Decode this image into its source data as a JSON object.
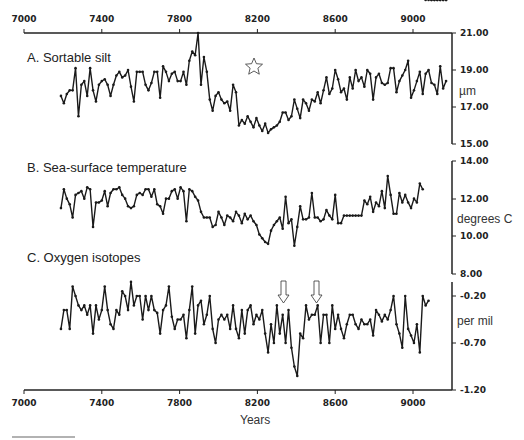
{
  "chart_data": [
    {
      "type": "line",
      "title": "A. Sortable silt",
      "xlabel": "Years",
      "ylabel": "µm",
      "xlim": [
        7000,
        9200
      ],
      "ylim": [
        15.0,
        21.0
      ],
      "yticks": [
        "21.00",
        "19.00",
        "17.00",
        "15.00"
      ],
      "annotations": [
        "star marker near 8200 yr"
      ],
      "x": [
        7190,
        7205,
        7220,
        7235,
        7250,
        7265,
        7280,
        7295,
        7310,
        7325,
        7340,
        7355,
        7370,
        7385,
        7400,
        7415,
        7430,
        7445,
        7460,
        7475,
        7490,
        7505,
        7520,
        7535,
        7550,
        7565,
        7580,
        7595,
        7610,
        7625,
        7640,
        7655,
        7670,
        7685,
        7700,
        7715,
        7730,
        7745,
        7760,
        7775,
        7790,
        7805,
        7820,
        7835,
        7850,
        7865,
        7880,
        7895,
        7910,
        7925,
        7940,
        7955,
        7970,
        7985,
        8000,
        8015,
        8030,
        8045,
        8060,
        8075,
        8090,
        8105,
        8120,
        8135,
        8150,
        8165,
        8180,
        8195,
        8210,
        8225,
        8240,
        8255,
        8270,
        8285,
        8300,
        8315,
        8330,
        8345,
        8360,
        8375,
        8390,
        8405,
        8420,
        8435,
        8450,
        8465,
        8480,
        8495,
        8510,
        8525,
        8540,
        8555,
        8570,
        8585,
        8600,
        8615,
        8630,
        8645,
        8660,
        8675,
        8690,
        8705,
        8720,
        8735,
        8750,
        8765,
        8780,
        8795,
        8810,
        8825,
        8840,
        8855,
        8870,
        8885,
        8900,
        8915,
        8930,
        8945,
        8960,
        8975,
        8990,
        9005,
        9020,
        9035,
        9050,
        9065,
        9080,
        9095,
        9110,
        9125,
        9140,
        9155,
        9170
      ],
      "values": [
        17.6,
        17.2,
        17.7,
        17.9,
        17.9,
        19.1,
        16.5,
        18.2,
        18.4,
        17.6,
        19.1,
        17.9,
        17.3,
        18.2,
        18.4,
        18.5,
        18.2,
        17.6,
        18.2,
        18.7,
        18.9,
        18.6,
        18.7,
        19.0,
        18.1,
        17.3,
        18.9,
        18.9,
        18.9,
        18.2,
        17.9,
        18.3,
        18.9,
        18.9,
        17.5,
        19.2,
        18.9,
        18.4,
        18.8,
        18.9,
        18.4,
        18.4,
        18.9,
        18.2,
        19.5,
        20.0,
        19.8,
        21.0,
        18.2,
        19.7,
        18.9,
        17.4,
        16.8,
        17.6,
        17.8,
        17.4,
        17.2,
        17.3,
        16.8,
        18.2,
        17.8,
        16.0,
        16.3,
        16.1,
        16.5,
        16.2,
        15.9,
        16.4,
        16.0,
        15.7,
        16.1,
        15.6,
        15.8,
        15.9,
        16.0,
        16.2,
        16.7,
        16.7,
        16.3,
        16.5,
        17.4,
        16.9,
        16.4,
        17.4,
        17.2,
        16.8,
        17.4,
        17.3,
        17.8,
        17.2,
        17.9,
        18.6,
        17.7,
        18.0,
        19.0,
        18.5,
        17.8,
        18.0,
        17.4,
        18.6,
        18.0,
        19.0,
        18.4,
        18.6,
        18.1,
        19.0,
        18.8,
        17.4,
        18.6,
        18.8,
        18.3,
        18.2,
        18.3,
        19.1,
        19.1,
        17.8,
        18.4,
        18.7,
        19.0,
        19.5,
        17.5,
        17.9,
        18.4,
        18.9,
        17.7,
        18.8,
        19.0,
        18.3,
        18.2,
        17.7,
        19.2,
        18.0,
        18.4,
        17.9
      ]
    },
    {
      "type": "line",
      "title": "B. Sea-surface temperature",
      "xlabel": "Years",
      "ylabel": "degrees C",
      "xlim": [
        7000,
        9200
      ],
      "ylim": [
        8.0,
        14.0
      ],
      "yticks": [
        "14.00",
        "12.00",
        "10.00",
        "8.00"
      ],
      "x": [
        7190,
        7205,
        7220,
        7235,
        7250,
        7265,
        7280,
        7295,
        7310,
        7325,
        7340,
        7355,
        7370,
        7385,
        7400,
        7415,
        7430,
        7445,
        7460,
        7475,
        7490,
        7505,
        7520,
        7535,
        7550,
        7565,
        7580,
        7595,
        7610,
        7625,
        7640,
        7655,
        7670,
        7685,
        7700,
        7715,
        7730,
        7745,
        7760,
        7775,
        7790,
        7805,
        7820,
        7835,
        7850,
        7865,
        7880,
        7895,
        7910,
        7925,
        7940,
        7955,
        7970,
        7985,
        8000,
        8015,
        8030,
        8045,
        8060,
        8075,
        8090,
        8105,
        8120,
        8135,
        8150,
        8165,
        8180,
        8195,
        8210,
        8225,
        8240,
        8255,
        8270,
        8285,
        8300,
        8315,
        8330,
        8345,
        8360,
        8375,
        8390,
        8405,
        8420,
        8435,
        8450,
        8465,
        8480,
        8495,
        8510,
        8525,
        8540,
        8555,
        8570,
        8585,
        8600,
        8615,
        8630,
        8645,
        8660,
        8675,
        8690,
        8705,
        8720,
        8735,
        8750,
        8765,
        8780,
        8795,
        8810,
        8825,
        8840,
        8855,
        8870,
        8885,
        8900,
        8915,
        8930,
        8945,
        8960,
        8975,
        8990,
        9005,
        9020,
        9035,
        9050,
        9065,
        9080,
        9095,
        9110,
        9125,
        9140,
        9155,
        9170
      ],
      "values": [
        11.5,
        12.5,
        12.0,
        11.7,
        11.0,
        12.2,
        12.3,
        12.4,
        12.0,
        12.6,
        12.5,
        10.5,
        11.8,
        11.8,
        11.9,
        12.4,
        11.6,
        12.3,
        12.5,
        12.5,
        12.6,
        12.2,
        12.0,
        11.6,
        11.5,
        11.6,
        12.2,
        12.3,
        12.2,
        12.5,
        12.5,
        12.1,
        12.5,
        11.7,
        11.6,
        11.2,
        12.0,
        12.0,
        12.4,
        12.5,
        12.0,
        12.6,
        12.4,
        10.8,
        12.5,
        12.4,
        12.1,
        11.9,
        11.3,
        11.0,
        11.0,
        11.0,
        10.5,
        10.6,
        11.3,
        11.0,
        10.6,
        11.1,
        11.0,
        10.8,
        11.3,
        11.1,
        10.7,
        11.2,
        10.9,
        11.1,
        10.8,
        10.6,
        10.1,
        9.9,
        9.7,
        9.6,
        10.3,
        10.6,
        10.8,
        11.0,
        10.4,
        12.1,
        10.7,
        10.9,
        9.5,
        10.5,
        11.6,
        10.9,
        10.9,
        11.0,
        12.3,
        11.0,
        11.0,
        10.8,
        10.9,
        11.4,
        11.1,
        10.9,
        12.2,
        10.7,
        10.7,
        11.1,
        11.1,
        11.1,
        11.1,
        11.1,
        11.1,
        11.1,
        11.9,
        11.7,
        12.1,
        11.3,
        11.8,
        11.6,
        12.4,
        11.5,
        13.2,
        12.2,
        11.2,
        11.2,
        12.3,
        11.8,
        12.2,
        11.8,
        11.5,
        12.0,
        11.8,
        12.8,
        12.5
      ]
    },
    {
      "type": "line",
      "title": "C. Oxygen isotopes",
      "xlabel": "Years",
      "ylabel": "per mil",
      "xlim": [
        7000,
        9200
      ],
      "ylim": [
        -1.2,
        0.0
      ],
      "yticks": [
        "-0.20",
        "-0.70",
        "-1.20"
      ],
      "annotations": [
        "down arrow near 8320 yr",
        "down arrow near 8510 yr"
      ],
      "x": [
        7190,
        7205,
        7220,
        7235,
        7250,
        7265,
        7280,
        7295,
        7310,
        7325,
        7340,
        7355,
        7370,
        7385,
        7400,
        7415,
        7430,
        7445,
        7460,
        7475,
        7490,
        7505,
        7520,
        7535,
        7550,
        7565,
        7580,
        7595,
        7610,
        7625,
        7640,
        7655,
        7670,
        7685,
        7700,
        7715,
        7730,
        7745,
        7760,
        7775,
        7790,
        7805,
        7820,
        7835,
        7850,
        7865,
        7880,
        7895,
        7910,
        7925,
        7940,
        7955,
        7970,
        7985,
        8000,
        8015,
        8030,
        8045,
        8060,
        8075,
        8090,
        8105,
        8120,
        8135,
        8150,
        8165,
        8180,
        8195,
        8210,
        8225,
        8240,
        8255,
        8270,
        8285,
        8300,
        8315,
        8330,
        8345,
        8360,
        8375,
        8390,
        8405,
        8420,
        8435,
        8450,
        8465,
        8480,
        8495,
        8510,
        8525,
        8540,
        8555,
        8570,
        8585,
        8600,
        8615,
        8630,
        8645,
        8660,
        8675,
        8690,
        8705,
        8720,
        8735,
        8750,
        8765,
        8780,
        8795,
        8810,
        8825,
        8840,
        8855,
        8870,
        8885,
        8900,
        8915,
        8930,
        8945,
        8960,
        8975,
        8990,
        9005,
        9020,
        9035,
        9050,
        9065,
        9080,
        9095,
        9110,
        9125,
        9140,
        9155,
        9170
      ],
      "values": [
        -0.55,
        -0.35,
        -0.35,
        -0.55,
        -0.1,
        -0.2,
        -0.3,
        -0.35,
        -0.3,
        -0.4,
        -0.3,
        -0.6,
        -0.3,
        -0.45,
        -0.35,
        -0.1,
        -0.35,
        -0.5,
        -0.55,
        -0.35,
        -0.4,
        -0.15,
        -0.2,
        -0.35,
        -0.05,
        -0.3,
        -0.2,
        -0.2,
        -0.45,
        -0.2,
        -0.35,
        -0.2,
        -0.35,
        -0.38,
        -0.6,
        -0.35,
        -0.3,
        -0.1,
        -0.42,
        -0.55,
        -0.45,
        -0.45,
        -0.4,
        -0.65,
        -0.35,
        -0.1,
        -0.6,
        -0.3,
        -0.25,
        -0.5,
        -0.4,
        -0.2,
        -0.55,
        -0.7,
        -0.45,
        -0.4,
        -0.45,
        -0.4,
        -0.55,
        -0.3,
        -0.55,
        -0.65,
        -0.35,
        -0.6,
        -0.35,
        -0.3,
        -0.5,
        -0.4,
        -0.45,
        -0.35,
        -0.6,
        -0.8,
        -0.5,
        -0.7,
        -0.3,
        -0.6,
        -0.4,
        -0.7,
        -0.35,
        -0.75,
        -0.95,
        -1.05,
        -0.6,
        -0.65,
        -0.3,
        -0.45,
        -0.4,
        -0.4,
        -0.3,
        -0.7,
        -0.4,
        -0.4,
        -0.7,
        -0.3,
        -0.55,
        -0.4,
        -0.55,
        -0.65,
        -0.5,
        -0.4,
        -0.4,
        -0.5,
        -0.55,
        -0.45,
        -0.5,
        -0.5,
        -0.45,
        -0.62,
        -0.35,
        -0.4,
        -0.47,
        -0.4,
        -0.45,
        -0.35,
        -0.2,
        -0.5,
        -0.6,
        -0.75,
        -0.2,
        -0.55,
        -0.62,
        -0.7,
        -0.5,
        -0.8,
        -0.2,
        -0.3,
        -0.25
      ]
    }
  ],
  "labels": {
    "panel_a": "A. Sortable silt",
    "panel_b": "B. Sea-surface temperature",
    "panel_c": "C. Oxygen isotopes",
    "unit_a": "µm",
    "unit_b": "degrees C",
    "unit_c": "per mil",
    "x_axis": "Years",
    "x_ticks": [
      "7000",
      "7400",
      "7800",
      "8200",
      "8600",
      "9000"
    ],
    "ticks_a": [
      "21.00",
      "19.00",
      "17.00",
      "15.00"
    ],
    "ticks_b": [
      "14.00",
      "12.00",
      "10.00",
      "8.00"
    ],
    "ticks_c": [
      "-0.20",
      "-0.70",
      "-1.20"
    ]
  },
  "colors": {
    "line": "#1a1a1a",
    "axis": "#222222"
  }
}
